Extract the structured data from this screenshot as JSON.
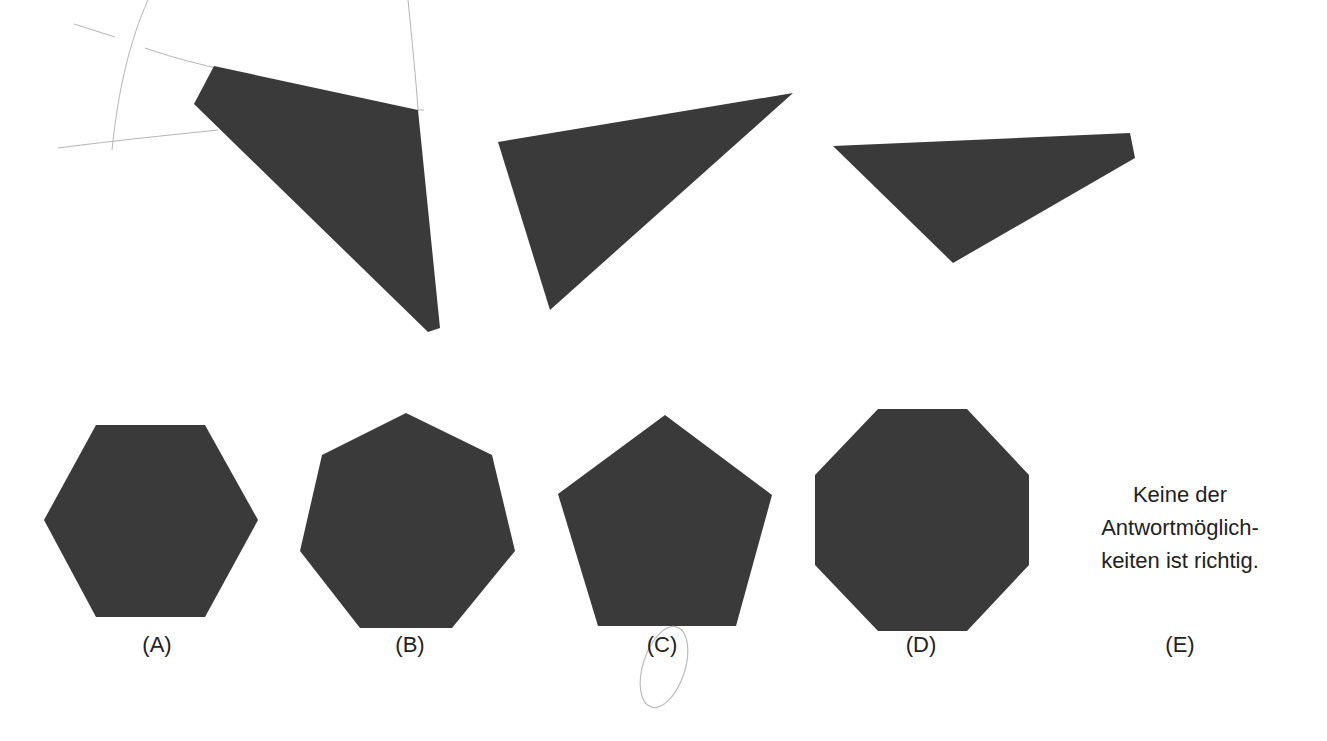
{
  "puzzle": {
    "pieces": [
      {
        "id": "piece-1",
        "shape": "quadrilateral",
        "points": "214,66 418,110 440,328 428,332 194,104"
      },
      {
        "id": "piece-2",
        "shape": "triangle",
        "points": "498,142 793,93 550,310"
      },
      {
        "id": "piece-3",
        "shape": "quadrilateral",
        "points": "833,146 1130,133 1135,158 953,263"
      }
    ],
    "fill_color": "#3a3a3a",
    "pencil_color": "#b0b0b0"
  },
  "options": [
    {
      "letter": "(A)",
      "shape": "hexagon",
      "points": "96,425 205,425 258,520 205,617 96,617 44,520",
      "label_x": 157
    },
    {
      "letter": "(B)",
      "shape": "heptagon",
      "points": "406,413 492,455 515,551 452,628 360,628 300,551 322,455",
      "label_x": 410
    },
    {
      "letter": "(C)",
      "shape": "pentagon",
      "points": "665,415 772,495 736,626 598,626 558,494",
      "label_x": 662
    },
    {
      "letter": "(D)",
      "shape": "octagon",
      "points": "878,409 967,409 1029,475 1029,565 967,631 878,631 815,565 815,475",
      "label_x": 921
    },
    {
      "letter": "(E)",
      "shape": "text",
      "text_lines": [
        "Keine der",
        "Antwortmöglich-",
        "keiten ist richtig."
      ],
      "label_x": 1180
    }
  ],
  "annotations": {
    "circled_option": "(C)"
  }
}
